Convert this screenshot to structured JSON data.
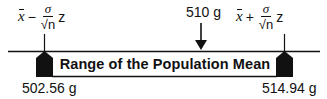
{
  "diagram": {
    "lower_formula": {
      "xbar": "x",
      "operator": "−",
      "numerator": "σ",
      "denominator": "√n",
      "multiplier": "z"
    },
    "upper_formula": {
      "xbar": "x",
      "operator": "+",
      "numerator": "σ",
      "denominator": "√n",
      "multiplier": "z"
    },
    "sample_value": "510 g",
    "range_label": "Range of the Population Mean",
    "lower_bound": "502.56 g",
    "upper_bound": "514.94 g",
    "colors": {
      "ink": "#111111",
      "background": "#ffffff"
    }
  }
}
